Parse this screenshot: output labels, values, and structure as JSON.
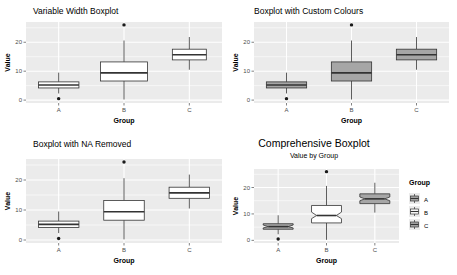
{
  "figure": {
    "background": "#ffffff",
    "panel_background": "#ebebeb",
    "grid_color": "#ffffff",
    "box_line_color": "#333333",
    "box_fill_white": "#ffffff",
    "box_fill_gray": "#a6a6a6",
    "outlier_color": "#1a1a1a"
  },
  "chart_data": [
    {
      "id": "variable-width-boxplot",
      "type": "box",
      "title": "Variable Width Boxplot",
      "subtitle": "",
      "xlabel": "Group",
      "ylabel": "Value",
      "categories": [
        "A",
        "B",
        "C"
      ],
      "ylim": [
        -1,
        27
      ],
      "yticks": [
        0,
        10,
        20
      ],
      "ytick_labels": [
        "0",
        "10",
        "20"
      ],
      "grid": true,
      "legend": "none",
      "notched": false,
      "variable_width": true,
      "box_widths": [
        0.62,
        0.72,
        0.52
      ],
      "fills": [
        "#ffffff",
        "#ffffff",
        "#ffffff"
      ],
      "boxes": [
        {
          "group": "A",
          "min": 2.3,
          "q1": 4.2,
          "median": 5.2,
          "q3": 6.3,
          "max": 9.5,
          "outliers": [
            0.5
          ]
        },
        {
          "group": "B",
          "min": 0.2,
          "q1": 6.6,
          "median": 9.4,
          "q3": 13.2,
          "max": 20.6,
          "outliers": [
            26.0
          ]
        },
        {
          "group": "C",
          "min": 10.5,
          "q1": 13.9,
          "median": 15.7,
          "q3": 17.6,
          "max": 21.8,
          "outliers": []
        }
      ]
    },
    {
      "id": "custom-colours-boxplot",
      "type": "box",
      "title": "Boxplot with Custom Colours",
      "subtitle": "",
      "xlabel": "Group",
      "ylabel": "Value",
      "categories": [
        "A",
        "B",
        "C"
      ],
      "ylim": [
        -1,
        27
      ],
      "yticks": [
        0,
        10,
        20
      ],
      "ytick_labels": [
        "0",
        "10",
        "20"
      ],
      "grid": true,
      "legend": "none",
      "notched": false,
      "variable_width": false,
      "box_widths": [
        0.62,
        0.62,
        0.62
      ],
      "fills": [
        "#a6a6a6",
        "#a6a6a6",
        "#a6a6a6"
      ],
      "boxes": [
        {
          "group": "A",
          "min": 2.3,
          "q1": 4.2,
          "median": 5.2,
          "q3": 6.3,
          "max": 9.5,
          "outliers": [
            0.5
          ]
        },
        {
          "group": "B",
          "min": 0.2,
          "q1": 6.6,
          "median": 9.4,
          "q3": 13.2,
          "max": 20.6,
          "outliers": [
            26.0
          ]
        },
        {
          "group": "C",
          "min": 10.5,
          "q1": 13.9,
          "median": 15.7,
          "q3": 17.6,
          "max": 21.8,
          "outliers": []
        }
      ]
    },
    {
      "id": "na-removed-boxplot",
      "type": "box",
      "title": "Boxplot with NA Removed",
      "subtitle": "",
      "xlabel": "Group",
      "ylabel": "Value",
      "categories": [
        "A",
        "B",
        "C"
      ],
      "ylim": [
        -1,
        27
      ],
      "yticks": [
        0,
        10,
        20
      ],
      "ytick_labels": [
        "0",
        "10",
        "20"
      ],
      "grid": true,
      "legend": "none",
      "notched": false,
      "variable_width": false,
      "box_widths": [
        0.62,
        0.62,
        0.62
      ],
      "fills": [
        "#ffffff",
        "#ffffff",
        "#ffffff"
      ],
      "boxes": [
        {
          "group": "A",
          "min": 2.3,
          "q1": 4.2,
          "median": 5.2,
          "q3": 6.3,
          "max": 9.5,
          "outliers": [
            0.5
          ]
        },
        {
          "group": "B",
          "min": 0.2,
          "q1": 6.6,
          "median": 9.4,
          "q3": 13.2,
          "max": 20.6,
          "outliers": [
            26.0
          ]
        },
        {
          "group": "C",
          "min": 10.5,
          "q1": 13.9,
          "median": 15.7,
          "q3": 17.6,
          "max": 21.8,
          "outliers": []
        }
      ]
    },
    {
      "id": "comprehensive-boxplot",
      "type": "box",
      "title": "Comprehensive Boxplot",
      "subtitle": "Value by Group",
      "xlabel": "Group",
      "ylabel": "Value",
      "categories": [
        "A",
        "B",
        "C"
      ],
      "ylim": [
        -1,
        27
      ],
      "yticks": [
        0,
        10,
        20
      ],
      "ytick_labels": [
        "0",
        "10",
        "20"
      ],
      "grid": true,
      "legend": "right",
      "legend_title": "Group",
      "legend_items": [
        {
          "label": "A",
          "fill": "#a6a6a6"
        },
        {
          "label": "B",
          "fill": "#ffffff"
        },
        {
          "label": "C",
          "fill": "#a6a6a6"
        }
      ],
      "notched": true,
      "variable_width": false,
      "box_widths": [
        0.62,
        0.62,
        0.62
      ],
      "fills": [
        "#a6a6a6",
        "#ffffff",
        "#a6a6a6"
      ],
      "boxes": [
        {
          "group": "A",
          "min": 2.3,
          "q1": 4.2,
          "median": 5.2,
          "q3": 6.3,
          "max": 9.5,
          "outliers": [
            0.5
          ],
          "notch_lower": 4.7,
          "notch_upper": 5.8
        },
        {
          "group": "B",
          "min": 0.2,
          "q1": 6.6,
          "median": 9.4,
          "q3": 13.2,
          "max": 20.6,
          "outliers": [
            26.0
          ],
          "notch_lower": 8.2,
          "notch_upper": 10.7
        },
        {
          "group": "C",
          "min": 10.5,
          "q1": 13.9,
          "median": 15.7,
          "q3": 17.6,
          "max": 21.8,
          "outliers": [],
          "notch_lower": 15.0,
          "notch_upper": 16.4
        }
      ]
    }
  ]
}
